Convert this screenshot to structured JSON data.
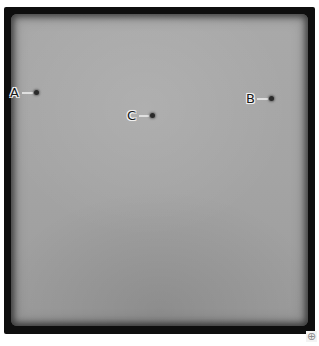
{
  "image": {
    "description": "Grayscale photograph-like panel with a dark vignetted border and three labeled point markers",
    "background_color": "#a6a6a6",
    "border_color": "#0e0e0e"
  },
  "markers": [
    {
      "label": "A",
      "x": 36,
      "y": 92,
      "label_x": 10,
      "label_y": 86,
      "leader_x": 22,
      "leader_w": 11
    },
    {
      "label": "C",
      "x": 152,
      "y": 115,
      "label_x": 127,
      "label_y": 109,
      "leader_x": 139,
      "leader_w": 10
    },
    {
      "label": "B",
      "x": 271,
      "y": 98,
      "label_x": 246,
      "label_y": 92,
      "leader_x": 257,
      "leader_w": 11
    }
  ],
  "controls": {
    "resize_handle_glyph": "⊕"
  }
}
